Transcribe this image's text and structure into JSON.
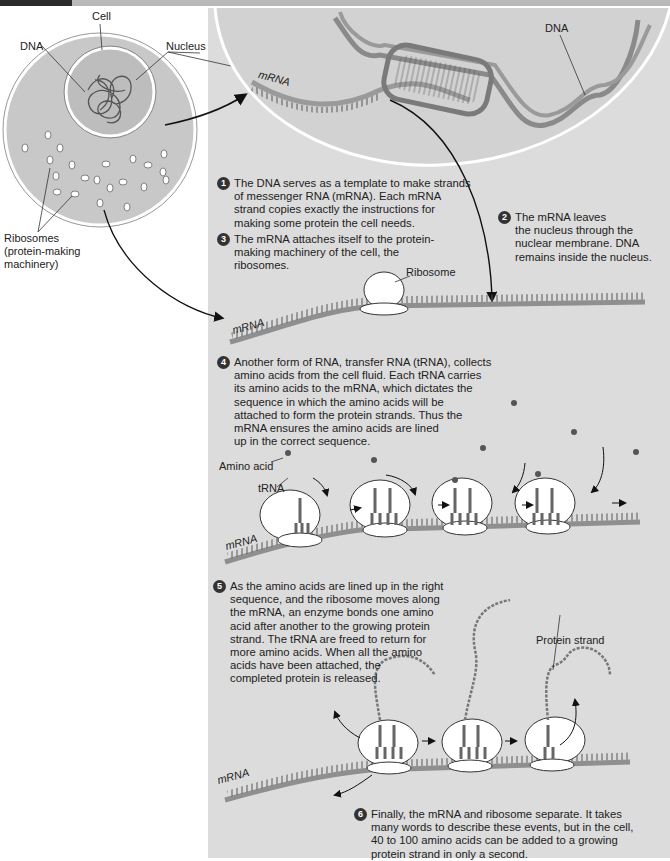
{
  "labels": {
    "cell": "Cell",
    "dna_left": "DNA",
    "nucleus": "Nucleus",
    "ribosomes": "Ribosomes\n(protein-making\nmachinery)",
    "dna_right": "DNA",
    "mrna_1": "mRNA",
    "mrna_2": "mRNA",
    "mrna_3": "mRNA",
    "mrna_4": "mRNA",
    "ribosome": "Ribosome",
    "amino_acid": "Amino acid",
    "trna": "tRNA",
    "protein_strand": "Protein strand"
  },
  "steps": [
    {
      "num": "1",
      "text": "The DNA serves as a template to make strands\nof messenger RNA (mRNA). Each mRNA\nstrand copies exactly the instructions for\nmaking some protein the cell needs."
    },
    {
      "num": "2",
      "text": "The mRNA leaves\nthe nucleus through the\nnuclear membrane. DNA\nremains inside the nucleus."
    },
    {
      "num": "3",
      "text": "The mRNA attaches itself to the protein-\nmaking machinery of the cell, the\nribosomes."
    },
    {
      "num": "4",
      "text": "Another form of RNA, transfer RNA (tRNA), collects\namino acids from the cell fluid. Each tRNA carries\nits amino acids to the mRNA, which dictates the\nsequence in which the amino acids will be\nattached to form the protein strands. Thus the\nmRNA ensures the amino acids are lined\nup in the correct sequence."
    },
    {
      "num": "5",
      "text": "As the amino acids are lined up in the right\nsequence, and the ribosome moves along\nthe mRNA, an enzyme bonds one amino\nacid after another to the growing protein\nstrand. The tRNA are freed to return for\nmore amino acids. When all the amino\nacids have been attached, the\ncompleted protein is released."
    },
    {
      "num": "6",
      "text": "Finally, the mRNA and ribosome separate. It takes\nmany words to describe these events, but in the cell,\n40 to 100 amino acids can be added to a growing\nprotein strand in only a second."
    }
  ],
  "colors": {
    "panel": "#dcdcdc",
    "cell_fill": "#c8c8c8",
    "strand": "#8a8a8a",
    "dark": "#333333"
  }
}
